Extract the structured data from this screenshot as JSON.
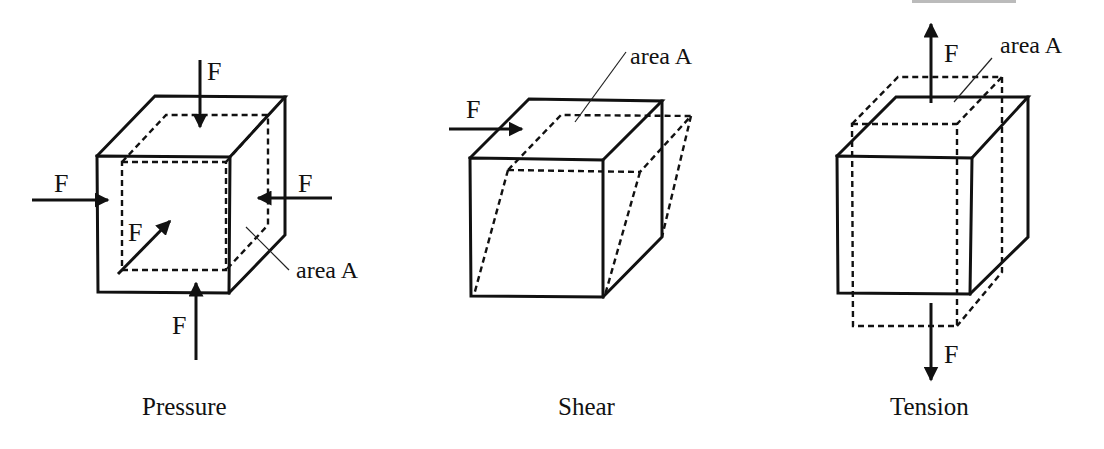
{
  "figure": {
    "cropped_header_fragment": "",
    "panels": [
      {
        "id": "pressure",
        "caption": "Pressure",
        "force_label": "F",
        "area_label": "area A",
        "force_count": 5
      },
      {
        "id": "shear",
        "caption": "Shear",
        "force_label": "F",
        "area_label": "area A",
        "force_count": 1
      },
      {
        "id": "tension",
        "caption": "Tension",
        "force_label": "F",
        "area_label": "area A",
        "force_count": 2
      }
    ],
    "colors": {
      "line": "#111111",
      "background": "#ffffff"
    }
  }
}
